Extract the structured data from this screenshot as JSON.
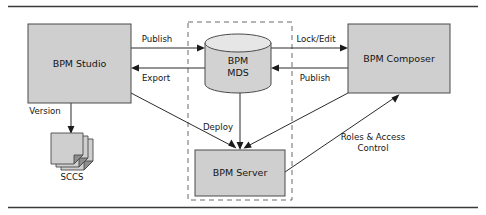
{
  "figure": {
    "background_color": "#ffffff",
    "rules": {
      "top_rule": "horizontal-rule",
      "bottom_rule": "horizontal-rule",
      "color": "#3a3a3a"
    }
  },
  "colors": {
    "box_fill": "#cfcfcf",
    "box_stroke": "#4a4a4a",
    "cylinder_fill": "#d2d2d2",
    "cylinder_top_fill": "#e6e6e6",
    "dashed_stroke": "#6a6a6a",
    "connector": "#2b2b2b",
    "text": "#151515",
    "fold_fill": "#8d8d8d"
  },
  "nodes": {
    "bpm_studio": {
      "label": "BPM Studio",
      "shape": "rectangle"
    },
    "bpm_mds": {
      "label_line1": "BPM",
      "label_line2": "MDS",
      "shape": "cylinder"
    },
    "bpm_composer": {
      "label": "BPM Composer",
      "shape": "rectangle"
    },
    "bpm_server": {
      "label": "BPM Server",
      "shape": "rectangle"
    },
    "sccs": {
      "label": "SCCS",
      "shape": "document-stack"
    }
  },
  "zone": {
    "name": "dashed-runtime-boundary",
    "style": "dashed",
    "contains": [
      "BPM MDS",
      "BPM Server"
    ]
  },
  "edges": [
    {
      "id": "studio-to-mds",
      "label": "Publish",
      "from": "BPM Studio",
      "to": "BPM MDS",
      "direction": "right"
    },
    {
      "id": "mds-to-studio",
      "label": "Export",
      "from": "BPM MDS",
      "to": "BPM Studio",
      "direction": "left"
    },
    {
      "id": "mds-to-composer",
      "label": "Lock/Edit",
      "from": "BPM MDS",
      "to": "BPM Composer",
      "direction": "right"
    },
    {
      "id": "composer-to-mds",
      "label": "Publish",
      "from": "BPM Composer",
      "to": "BPM MDS",
      "direction": "left"
    },
    {
      "id": "studio-to-sccs",
      "label": "Version",
      "from": "BPM Studio",
      "to": "SCCS",
      "direction": "down"
    },
    {
      "id": "mds-to-server",
      "label": "Deploy",
      "from": "BPM MDS",
      "to": "BPM Server",
      "direction": "down"
    },
    {
      "id": "studio-to-server",
      "label": "",
      "from": "BPM Studio",
      "to": "BPM Server",
      "direction": "diagonal-down-right"
    },
    {
      "id": "composer-to-server",
      "label": "",
      "from": "BPM Composer",
      "to": "BPM Server",
      "direction": "diagonal-down-left"
    },
    {
      "id": "server-to-composer",
      "label_line1": "Roles & Access",
      "label_line2": "Control",
      "from": "BPM Server",
      "to": "BPM Composer",
      "direction": "diagonal-up-right"
    }
  ]
}
